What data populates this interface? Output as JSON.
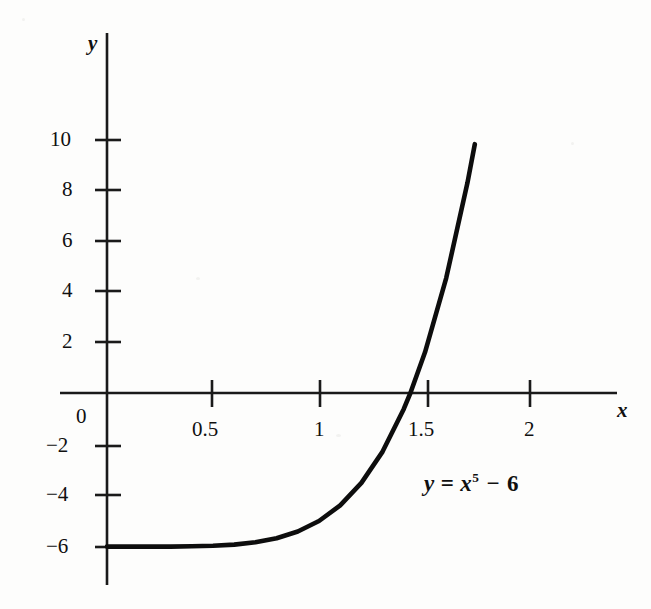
{
  "chart_data": {
    "type": "line",
    "title": "",
    "subtitle": "",
    "xlabel": "x",
    "ylabel": "y",
    "equation_label": "y = x⁵ − 6",
    "equation_parts": {
      "lhs": "y",
      "equals": "=",
      "base": "x",
      "exponent": "5",
      "minus": "−",
      "constant": "6"
    },
    "function": "y = x^5 - 6",
    "xlim": [
      -0.22,
      2.39
    ],
    "ylim": [
      -14.06,
      14.06
    ],
    "grid": false,
    "legend": "none",
    "axis_style": "centered-cross",
    "xticks": [
      0.5,
      1,
      1.5,
      2
    ],
    "xtick_labels": [
      "0.5",
      "1",
      "1.5",
      "2"
    ],
    "yticks": [
      10,
      8,
      6,
      4,
      2,
      -2,
      -4,
      -6
    ],
    "ytick_labels": [
      "10",
      "8",
      "6",
      "4",
      "2",
      "−2",
      "−4",
      "−6"
    ],
    "origin_label": "0",
    "series": [
      {
        "name": "y = x^5 - 6",
        "color": "#0d0d0d",
        "linewidth": 4.6,
        "x_start": 0,
        "x_end": 1.735,
        "points": [
          {
            "x": 0.0,
            "y": -6.0
          },
          {
            "x": 0.1,
            "y": -6.0
          },
          {
            "x": 0.2,
            "y": -6.0
          },
          {
            "x": 0.3,
            "y": -6.0
          },
          {
            "x": 0.4,
            "y": -5.99
          },
          {
            "x": 0.5,
            "y": -5.97
          },
          {
            "x": 0.6,
            "y": -5.92
          },
          {
            "x": 0.7,
            "y": -5.83
          },
          {
            "x": 0.8,
            "y": -5.67
          },
          {
            "x": 0.9,
            "y": -5.41
          },
          {
            "x": 1.0,
            "y": -5.0
          },
          {
            "x": 1.1,
            "y": -4.39
          },
          {
            "x": 1.2,
            "y": -3.51
          },
          {
            "x": 1.3,
            "y": -2.29
          },
          {
            "x": 1.4,
            "y": -0.62
          },
          {
            "x": 1.431,
            "y": 0.0
          },
          {
            "x": 1.5,
            "y": 1.59
          },
          {
            "x": 1.6,
            "y": 4.49
          },
          {
            "x": 1.7,
            "y": 8.2
          },
          {
            "x": 1.735,
            "y": 9.72
          }
        ],
        "annotations": [
          {
            "text": "zero crossing",
            "x": 1.431,
            "y": 0
          }
        ]
      }
    ]
  },
  "axes": {
    "x_axis_name": "x",
    "y_axis_name": "y"
  },
  "colors": {
    "background": "#fdfdfc",
    "axis": "#1a1a1a",
    "curve": "#0d0d0d",
    "text": "#101010"
  }
}
